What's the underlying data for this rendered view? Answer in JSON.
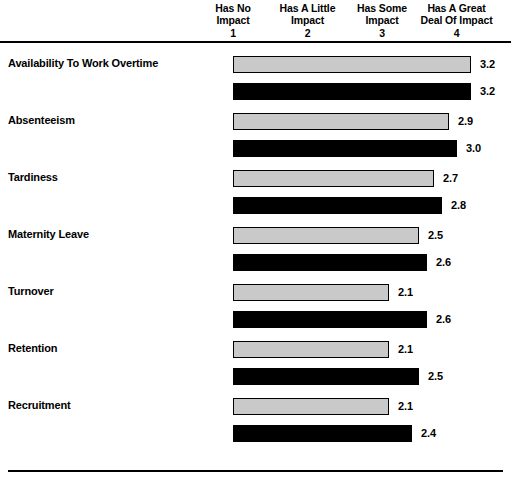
{
  "chart_data": {
    "type": "bar",
    "title": "",
    "subtitle": "",
    "xlabel": "",
    "ylabel": "",
    "orientation": "horizontal",
    "xlim": [
      0,
      4
    ],
    "grid": false,
    "legend": "none",
    "axis_tick_labels": [
      {
        "value": 1,
        "lines": [
          "Has No",
          "Impact"
        ],
        "number": "1"
      },
      {
        "value": 2,
        "lines": [
          "Has A Little",
          "Impact"
        ],
        "number": "2"
      },
      {
        "value": 3,
        "lines": [
          "Has Some",
          "Impact"
        ],
        "number": "3"
      },
      {
        "value": 4,
        "lines": [
          "Has A Great",
          "Deal Of Impact"
        ],
        "number": "4"
      }
    ],
    "categories": [
      "Availability To Work Overtime",
      "Absenteeism",
      "Tardiness",
      "Maternity Leave",
      "Turnover",
      "Retention",
      "Recruitment"
    ],
    "series": [
      {
        "name": "series-a",
        "style": "light-gray-filled",
        "color": "#c9c9c9",
        "values": [
          3.2,
          2.9,
          2.7,
          2.5,
          2.1,
          2.1,
          2.1
        ],
        "labels": [
          "3.2",
          "2.9",
          "2.7",
          "2.5",
          "2.1",
          "2.1",
          "2.1"
        ]
      },
      {
        "name": "series-b",
        "style": "black-filled",
        "color": "#000000",
        "values": [
          3.2,
          3.0,
          2.8,
          2.6,
          2.6,
          2.5,
          2.4
        ],
        "labels": [
          "3.2",
          "3.0",
          "2.8",
          "2.6",
          "2.6",
          "2.5",
          "2.4"
        ]
      }
    ]
  },
  "layout": {
    "bar_origin_x": 233,
    "pixels_per_unit": 74.5,
    "row_pitch": 57,
    "row_top_offset": 6
  }
}
